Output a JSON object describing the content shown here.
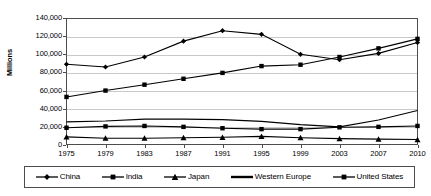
{
  "chart_data": {
    "type": "line",
    "title": "",
    "subtitle": "",
    "xlabel": "",
    "ylabel": "Millions",
    "categories": [
      "1975",
      "1979",
      "1983",
      "1987",
      "1991",
      "1995",
      "1999",
      "2003",
      "2007",
      "2010"
    ],
    "ylim": [
      0,
      140000
    ],
    "ytick_step": 20000,
    "ytick_labels": [
      "140,000",
      "120,000",
      "100,000",
      "80,000",
      "60,000",
      "40,000",
      "20,000",
      "0"
    ],
    "ytick_values": [
      140000,
      120000,
      100000,
      80000,
      60000,
      40000,
      20000,
      0
    ],
    "grid": true,
    "legend_position": "bottom",
    "series": [
      {
        "name": "China",
        "marker": "diamond",
        "color": "#000000",
        "values": [
          89000,
          86000,
          97000,
          114500,
          126000,
          122000,
          100000,
          94000,
          101000,
          113000
        ]
      },
      {
        "name": "India",
        "marker": "square",
        "color": "#000000",
        "values": [
          53000,
          60000,
          66500,
          73000,
          79500,
          87000,
          88500,
          97000,
          106500,
          117000
        ]
      },
      {
        "name": "Japan",
        "marker": "triangle",
        "color": "#000000",
        "values": [
          9000,
          7500,
          7500,
          8000,
          8500,
          9500,
          8000,
          7000,
          6500,
          6000
        ]
      },
      {
        "name": "Western Europe",
        "marker": "none",
        "color": "#000000",
        "values": [
          25500,
          26500,
          28500,
          28500,
          28000,
          26000,
          22500,
          20000,
          27500,
          38000
        ]
      },
      {
        "name": "United States",
        "marker": "square",
        "color": "#000000",
        "values": [
          19000,
          20500,
          21000,
          20000,
          18500,
          17500,
          17500,
          19500,
          20000,
          21000
        ]
      }
    ]
  }
}
